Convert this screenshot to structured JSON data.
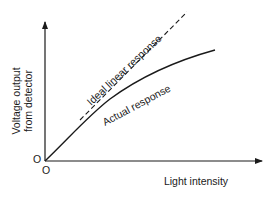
{
  "diagram": {
    "type": "response-curve",
    "y_axis": {
      "label_line1": "Voltage output",
      "label_line2": "from detector",
      "origin_label": "O"
    },
    "x_axis": {
      "label": "Light intensity",
      "origin_label": "O"
    },
    "curves": [
      {
        "name": "ideal",
        "label": "Ideal linear response",
        "style": "dashed"
      },
      {
        "name": "actual",
        "label": "Actual response",
        "style": "solid"
      }
    ],
    "colors": {
      "ink": "#1a1a1a",
      "background": "#ffffff"
    }
  }
}
